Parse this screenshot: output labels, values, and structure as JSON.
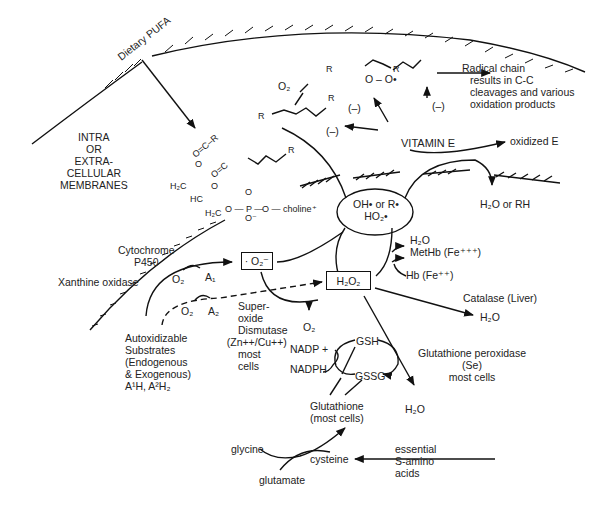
{
  "diagram": {
    "title": "",
    "regions": {
      "membrane_label": [
        "INTRA",
        "OR",
        "EXTRA-",
        "CELLULAR",
        "MEMBRANES"
      ],
      "dietary_pufa": "Dietary PUFA"
    },
    "lipid": {
      "choline": "O — choline⁺",
      "h2c_top": "H₂C",
      "hc": "HC",
      "h2c_bottom": "H₂C",
      "phosphate": "O — P —",
      "r_labels": [
        "R",
        "R",
        "R",
        "R",
        "R"
      ]
    },
    "peroxyl": {
      "o2": "O₂",
      "peroxy": "O – O•",
      "radical_chain": [
        "Radical chain",
        "results in C-C",
        "cleavages and various",
        "oxidation products"
      ]
    },
    "inhibition": [
      "(–)",
      "(–)",
      "(–)"
    ],
    "vitamin_e": {
      "label": "VITAMIN E",
      "oxidized": "oxidized E",
      "product": "H₂O or RH"
    },
    "radicals": {
      "line1": "OH• or R•",
      "line2": "HO₂•"
    },
    "sources": {
      "cytochrome": [
        "Cytochrome",
        "P450"
      ],
      "xanthine": "Xanthine oxidase",
      "o2_a": "O₂",
      "a1": "A₁",
      "o2_b": "O₂",
      "a2": "A₂",
      "autox": [
        "Autoxidizable",
        "Substrates",
        "(Endogenous",
        "& Exogenous)",
        "A¹H, A²H₂"
      ]
    },
    "superoxide": {
      "box": "· O₂⁻",
      "sod": [
        "Super-",
        "oxide",
        "Dismutase",
        "(Zn++/Cu++)",
        "most",
        "cells"
      ],
      "o2": "O₂"
    },
    "h2o2": {
      "box": "H₂O₂",
      "h2o_top": "H₂O",
      "methb": "MetHb (Fe⁺⁺⁺)",
      "hb": "Hb (Fe⁺⁺)",
      "catalase": "Catalase (Liver)",
      "catalase_h2o": "H₂O"
    },
    "glutathione": {
      "nadp": "NADP +",
      "nadph": "NADPH",
      "gsh": "GSH",
      "gssg": "GSSG",
      "pool": [
        "Glutathione",
        "(most cells)"
      ],
      "peroxidase": [
        "Glutathione peroxidase",
        "(Se)",
        "most cells"
      ],
      "h2o": "H₂O"
    },
    "synthesis": {
      "glycine": "glycine",
      "glutamate": "glutamate",
      "cysteine": "cysteine",
      "essential": [
        "essential",
        "S-amino",
        "acids"
      ]
    }
  }
}
